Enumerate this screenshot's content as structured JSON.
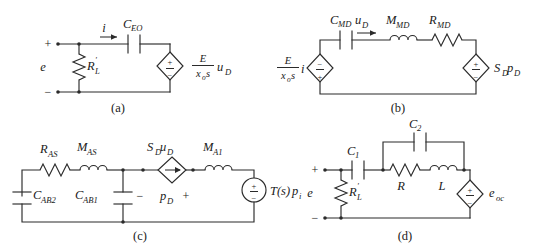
{
  "figure": {
    "background_color": "#ffffff",
    "line_color": "#2b2b2b",
    "panels": [
      {
        "id": "a",
        "caption": "(a)",
        "description": "Series capacitor C_EO with shunt resistor R_L' driven by source e, terminated in a dependent voltage source",
        "terminals": {
          "plus": "+",
          "minus": "−",
          "source_label": "e"
        },
        "components": [
          {
            "name": "resistor-RL",
            "type": "resistor",
            "label": "R",
            "sub": "L",
            "prime": true
          },
          {
            "name": "capacitor-CEO",
            "type": "capacitor",
            "label": "C",
            "sub": "EO"
          },
          {
            "name": "current-label-i",
            "type": "current-arrow",
            "label": "i"
          },
          {
            "name": "source-E-xos-uD",
            "type": "diamond-voltage-source",
            "polarity_top": "+",
            "polarity_bottom": "−",
            "label_num": "E",
            "label_den_base": "x",
            "label_den_sub": "o",
            "label_den_tail": "s",
            "label_tail": "u",
            "label_tail_sub": "D"
          }
        ]
      },
      {
        "id": "b",
        "caption": "(b)",
        "description": "Series loop: dependent source E/(x_o s) i, capacitor C_MD, inductor M_MD, resistor R_MD, dependent source S_D p_D",
        "components": [
          {
            "name": "source-E-xos-i",
            "type": "diamond-voltage-source",
            "polarity_top": "−",
            "polarity_bottom": "+",
            "label_num": "E",
            "label_den_base": "x",
            "label_den_sub": "o",
            "label_den_tail": "s",
            "label_tail": "i"
          },
          {
            "name": "capacitor-CMD",
            "type": "capacitor",
            "label": "C",
            "sub": "MD"
          },
          {
            "name": "voltage-label-uD",
            "type": "voltage-arrow",
            "label": "u",
            "sub": "D"
          },
          {
            "name": "inductor-MMD",
            "type": "inductor",
            "label": "M",
            "sub": "MD"
          },
          {
            "name": "resistor-RMD",
            "type": "resistor",
            "label": "R",
            "sub": "MD"
          },
          {
            "name": "source-SD-pD",
            "type": "diamond-voltage-source",
            "polarity_top": "+",
            "polarity_bottom": "−",
            "label": "S",
            "sub": "D",
            "label2": "p",
            "sub2": "D"
          }
        ]
      },
      {
        "id": "c",
        "caption": "(c)",
        "description": "Ladder: C_AB2, R_AS, M_AS, C_AB1, dependent current source S_D u_D across p_D, M_A1, source T(s) p_i",
        "components": [
          {
            "name": "resistor-RAS",
            "type": "resistor",
            "label": "R",
            "sub": "AS"
          },
          {
            "name": "inductor-MAS",
            "type": "inductor",
            "label": "M",
            "sub": "AS"
          },
          {
            "name": "capacitor-CAB2",
            "type": "capacitor",
            "label": "C",
            "sub": "AB2"
          },
          {
            "name": "capacitor-CAB1",
            "type": "capacitor",
            "label": "C",
            "sub": "AB1"
          },
          {
            "name": "source-SD-uD",
            "type": "diamond-current-source",
            "label": "S",
            "sub": "D",
            "label2": "u",
            "sub2": "D"
          },
          {
            "name": "node-voltage-pD",
            "type": "polarity-label",
            "minus": "−",
            "label": "p",
            "sub": "D",
            "plus": "+"
          },
          {
            "name": "inductor-MA1",
            "type": "inductor",
            "label": "M",
            "sub": "A1"
          },
          {
            "name": "source-Ts-pi",
            "type": "circle-voltage-source",
            "polarity_top": "+",
            "polarity_bottom": "−",
            "label": "T(s)",
            "label2": "p",
            "sub2": "i"
          }
        ]
      },
      {
        "id": "d",
        "caption": "(d)",
        "description": "Source e with shunt R_L', series C_1, then C_2 in parallel with R and L, terminated in source e_oc",
        "terminals": {
          "plus": "+",
          "minus": "−",
          "source_label": "e"
        },
        "components": [
          {
            "name": "resistor-RL",
            "type": "resistor",
            "label": "R",
            "sub": "L",
            "prime": true
          },
          {
            "name": "capacitor-C1",
            "type": "capacitor",
            "label": "C",
            "sub": "1"
          },
          {
            "name": "capacitor-C2",
            "type": "capacitor",
            "label": "C",
            "sub": "2"
          },
          {
            "name": "resistor-R",
            "type": "resistor",
            "label": "R"
          },
          {
            "name": "inductor-L",
            "type": "inductor",
            "label": "L"
          },
          {
            "name": "source-eoc",
            "type": "diamond-voltage-source",
            "polarity_top": "+",
            "polarity_bottom": "−",
            "label": "e",
            "sub": "oc"
          }
        ]
      }
    ],
    "captions": {
      "a": "(a)",
      "b": "(b)",
      "c": "(c)",
      "d": "(d)"
    },
    "labels": {
      "a_plus": "+",
      "a_minus": "−",
      "a_e": "e",
      "a_i": "i",
      "a_CEO_base": "C",
      "a_CEO_sub": "EO",
      "a_RL_base": "R",
      "a_RL_sub": "L",
      "a_RL_prime": "′",
      "a_src_num": "E",
      "a_src_den_x": "x",
      "a_src_den_o": "o",
      "a_src_den_s": "s",
      "a_src_u": "u",
      "a_src_u_sub": "D",
      "b_src_num": "E",
      "b_src_den_x": "x",
      "b_src_den_o": "o",
      "b_src_den_s": "s",
      "b_src_i": "i",
      "b_CMD_base": "C",
      "b_CMD_sub": "MD",
      "b_uD_base": "u",
      "b_uD_sub": "D",
      "b_MMD_base": "M",
      "b_MMD_sub": "MD",
      "b_RMD_base": "R",
      "b_RMD_sub": "MD",
      "b_SD_base": "S",
      "b_SD_sub": "D",
      "b_pD_base": "p",
      "b_pD_sub": "D",
      "c_RAS_base": "R",
      "c_RAS_sub": "AS",
      "c_MAS_base": "M",
      "c_MAS_sub": "AS",
      "c_CAB2_base": "C",
      "c_CAB2_sub": "AB2",
      "c_CAB1_base": "C",
      "c_CAB1_sub": "AB1",
      "c_SD_base": "S",
      "c_SD_sub": "D",
      "c_uD_base": "u",
      "c_uD_sub": "D",
      "c_minus": "−",
      "c_pD_base": "p",
      "c_pD_sub": "D",
      "c_plus": "+",
      "c_MA1_base": "M",
      "c_MA1_sub": "A1",
      "c_Ts": "T(s)",
      "c_pi_base": "p",
      "c_pi_sub": "i",
      "d_plus": "+",
      "d_minus": "−",
      "d_e": "e",
      "d_RL_base": "R",
      "d_RL_sub": "L",
      "d_RL_prime": "′",
      "d_C1_base": "C",
      "d_C1_sub": "1",
      "d_C2_base": "C",
      "d_C2_sub": "2",
      "d_R": "R",
      "d_L": "L",
      "d_eoc_base": "e",
      "d_eoc_sub": "oc"
    }
  }
}
